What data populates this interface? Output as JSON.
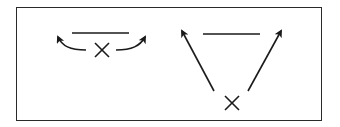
{
  "diagram": {
    "stroke_color": "#1a1a1a",
    "frame_color": "#2a2a2a",
    "background": "#ffffff",
    "panels": [
      {
        "id": "left",
        "elements": [
          "horizontal-bar",
          "x-mark",
          "curved-arrow-left",
          "curved-arrow-right"
        ]
      },
      {
        "id": "right",
        "elements": [
          "horizontal-bar",
          "x-mark",
          "straight-arrow-left",
          "straight-arrow-right"
        ]
      }
    ]
  }
}
